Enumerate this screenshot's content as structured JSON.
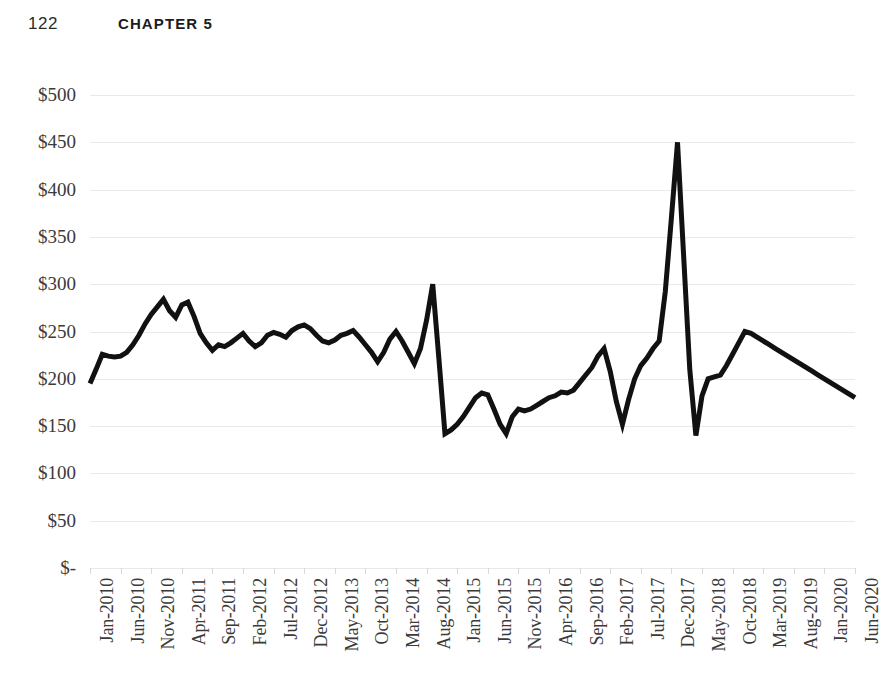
{
  "page": {
    "folio": "122",
    "running_head": "CHAPTER 5"
  },
  "chart_data": {
    "type": "line",
    "title": "",
    "xlabel": "",
    "ylabel": "",
    "ylim": [
      0,
      500
    ],
    "ytick_step": 50,
    "ytick_labels": [
      "$500",
      "$450",
      "$400",
      "$350",
      "$300",
      "$250",
      "$200",
      "$150",
      "$100",
      "$50",
      "$-"
    ],
    "ytick_values": [
      500,
      450,
      400,
      350,
      300,
      250,
      200,
      150,
      100,
      50,
      0
    ],
    "grid": true,
    "legend": "none",
    "line_color": "#111111",
    "line_width": 5,
    "gridline_color": "#e9e9e9",
    "xtick_interval_months": 5,
    "xtick_labels": [
      "Jan-2010",
      "Jun-2010",
      "Nov-2010",
      "Apr-2011",
      "Sep-2011",
      "Feb-2012",
      "Jul-2012",
      "Dec-2012",
      "May-2013",
      "Oct-2013",
      "Mar-2014",
      "Aug-2014",
      "Jan-2015",
      "Jun-2015",
      "Nov-2015",
      "Apr-2016",
      "Sep-2016",
      "Feb-2017",
      "Jul-2017",
      "Dec-2017",
      "May-2018",
      "Oct-2018",
      "Mar-2019",
      "Aug-2019",
      "Jan-2020",
      "Jun-2020"
    ],
    "x": [
      "Jan-2010",
      "Feb-2010",
      "Mar-2010",
      "Apr-2010",
      "May-2010",
      "Jun-2010",
      "Jul-2010",
      "Aug-2010",
      "Sep-2010",
      "Oct-2010",
      "Nov-2010",
      "Dec-2010",
      "Jan-2011",
      "Feb-2011",
      "Mar-2011",
      "Apr-2011",
      "May-2011",
      "Jun-2011",
      "Jul-2011",
      "Aug-2011",
      "Sep-2011",
      "Oct-2011",
      "Nov-2011",
      "Dec-2011",
      "Jan-2012",
      "Feb-2012",
      "Mar-2012",
      "Apr-2012",
      "May-2012",
      "Jun-2012",
      "Jul-2012",
      "Aug-2012",
      "Sep-2012",
      "Oct-2012",
      "Nov-2012",
      "Dec-2012",
      "Jan-2013",
      "Feb-2013",
      "Mar-2013",
      "Apr-2013",
      "May-2013",
      "Jun-2013",
      "Jul-2013",
      "Aug-2013",
      "Sep-2013",
      "Oct-2013",
      "Nov-2013",
      "Dec-2013",
      "Jan-2014",
      "Feb-2014",
      "Mar-2014",
      "Apr-2014",
      "May-2014",
      "Jun-2014",
      "Jul-2014",
      "Aug-2014",
      "Sep-2014",
      "Oct-2014",
      "Nov-2014",
      "Dec-2014",
      "Jan-2015",
      "Feb-2015",
      "Mar-2015",
      "Apr-2015",
      "May-2015",
      "Jun-2015",
      "Jul-2015",
      "Aug-2015",
      "Sep-2015",
      "Oct-2015",
      "Nov-2015",
      "Dec-2015",
      "Jan-2016",
      "Feb-2016",
      "Mar-2016",
      "Apr-2016",
      "May-2016",
      "Jun-2016",
      "Jul-2016",
      "Aug-2016",
      "Sep-2016",
      "Oct-2016",
      "Nov-2016",
      "Dec-2016",
      "Jan-2017",
      "Feb-2017",
      "Mar-2017",
      "Apr-2017",
      "May-2017",
      "Jun-2017",
      "Jul-2017",
      "Aug-2017",
      "Sep-2017",
      "Oct-2017",
      "Nov-2017",
      "Dec-2017",
      "Jan-2018",
      "Feb-2018",
      "Mar-2018",
      "Apr-2018",
      "May-2018",
      "Jun-2018",
      "Jul-2018",
      "Aug-2018",
      "Sep-2018",
      "Oct-2018",
      "Nov-2018",
      "Dec-2018",
      "Jan-2019",
      "Feb-2019",
      "Mar-2019",
      "Apr-2019",
      "May-2019",
      "Jun-2019",
      "Jul-2019",
      "Aug-2019",
      "Sep-2019",
      "Oct-2019",
      "Nov-2019",
      "Dec-2019",
      "Jan-2020",
      "Feb-2020",
      "Mar-2020",
      "Apr-2020",
      "May-2020",
      "Jun-2020"
    ],
    "values": [
      195,
      210,
      226,
      224,
      223,
      224,
      228,
      236,
      246,
      258,
      268,
      276,
      284,
      272,
      265,
      278,
      281,
      266,
      248,
      238,
      230,
      236,
      234,
      238,
      243,
      248,
      240,
      234,
      238,
      246,
      249,
      247,
      244,
      251,
      255,
      257,
      253,
      246,
      240,
      238,
      241,
      246,
      248,
      251,
      244,
      236,
      228,
      218,
      228,
      242,
      250,
      240,
      228,
      216,
      232,
      262,
      300,
      222,
      142,
      146,
      152,
      160,
      170,
      180,
      185,
      183,
      168,
      152,
      142,
      160,
      168,
      166,
      168,
      172,
      176,
      180,
      182,
      186,
      185,
      188,
      196,
      204,
      212,
      224,
      232,
      208,
      176,
      152,
      178,
      200,
      214,
      222,
      232,
      240,
      292,
      370,
      450,
      330,
      210,
      140,
      182,
      200,
      202,
      204,
      214,
      226,
      238,
      250,
      248,
      244,
      240,
      236,
      232,
      228,
      224,
      220,
      216,
      212,
      208,
      204,
      200,
      196,
      192,
      188,
      184,
      180
    ]
  }
}
